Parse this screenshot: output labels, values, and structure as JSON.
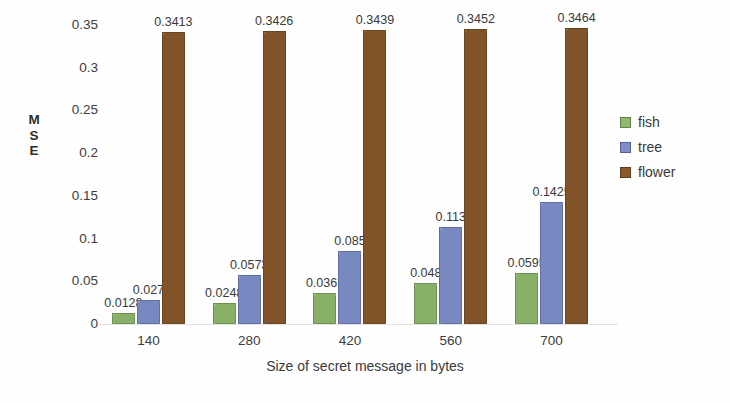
{
  "chart_data": {
    "type": "bar",
    "title": "",
    "xlabel": "Size of secret message in bytes",
    "ylabel": "MSE",
    "ylabel_letters": [
      "M",
      "S",
      "E"
    ],
    "categories": [
      "140",
      "280",
      "420",
      "560",
      "700"
    ],
    "series": [
      {
        "name": "fish",
        "color": "#8FB96D",
        "values": [
          0.0128,
          0.0248,
          0.0362,
          0.048,
          0.0595
        ],
        "labels": [
          "0.0128",
          "0.0248",
          "0.0362",
          "0.048",
          "0.0595"
        ]
      },
      {
        "name": "tree",
        "color": "#7E8FCB",
        "values": [
          0.0277,
          0.0573,
          0.0856,
          0.1136,
          0.1425
        ],
        "labels": [
          "0.027",
          "0.0573",
          "0.085",
          "0.113",
          "0.1425"
        ]
      },
      {
        "name": "flower",
        "color": "#8B5A2B",
        "values": [
          0.3413,
          0.3426,
          0.3439,
          0.3452,
          0.3464
        ],
        "labels": [
          "0.3413",
          "0.3426",
          "0.3439",
          "0.3452",
          "0.3464"
        ]
      }
    ],
    "ylim": [
      0,
      0.35
    ],
    "yticks": [
      "0",
      "0.05",
      "0.1",
      "0.15",
      "0.2",
      "0.25",
      "0.3",
      "0.35"
    ],
    "ytick_values": [
      0,
      0.05,
      0.1,
      0.15,
      0.2,
      0.25,
      0.3,
      0.35
    ],
    "grid": false,
    "legend_position": "right",
    "legend": [
      "fish",
      "tree",
      "flower"
    ],
    "background_color": "#ffffff"
  }
}
